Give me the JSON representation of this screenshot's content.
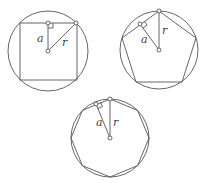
{
  "diagrams": [
    {
      "name": "square",
      "sides": 4,
      "apothem_label": "a",
      "radius_label": "r"
    },
    {
      "name": "pentagon",
      "sides": 5,
      "apothem_label": "a",
      "radius_label": "r"
    },
    {
      "name": "octagon",
      "sides": 8,
      "apothem_label": "a",
      "radius_label": "r"
    }
  ],
  "colors": {
    "stroke": "#555555",
    "background": "#ffffff"
  }
}
